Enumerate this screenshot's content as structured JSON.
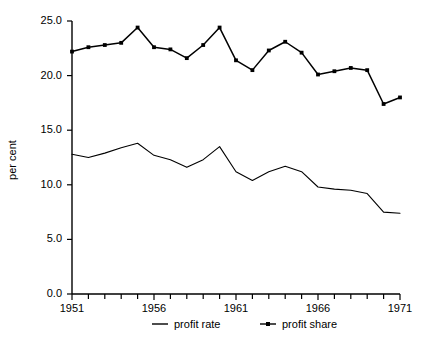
{
  "chart_data": {
    "type": "line",
    "title": "",
    "subtitle": "",
    "xlabel": "",
    "ylabel": "per cent",
    "x": [
      1951,
      1952,
      1953,
      1954,
      1955,
      1956,
      1957,
      1958,
      1959,
      1960,
      1961,
      1962,
      1963,
      1964,
      1965,
      1966,
      1967,
      1968,
      1969,
      1970,
      1971
    ],
    "xlim": [
      1951,
      1971
    ],
    "ylim": [
      0.0,
      25.0
    ],
    "grid": false,
    "legend_position": "bottom",
    "x_tick_labels": [
      "1951",
      "1956",
      "1961",
      "1966",
      "1971"
    ],
    "x_tick_values": [
      1951,
      1956,
      1961,
      1966,
      1971
    ],
    "x_minor_ticks_every": 1,
    "y_tick_labels": [
      "0.0",
      "5.0",
      "10.0",
      "15.0",
      "20.0",
      "25.0"
    ],
    "y_tick_values": [
      0.0,
      5.0,
      10.0,
      15.0,
      20.0,
      25.0
    ],
    "series": [
      {
        "name": "profit rate",
        "color": "#000000",
        "markers": false,
        "values": [
          12.8,
          12.5,
          12.9,
          13.4,
          13.8,
          12.7,
          12.3,
          11.6,
          12.3,
          13.5,
          11.2,
          10.4,
          11.2,
          11.7,
          11.2,
          9.8,
          9.6,
          9.5,
          9.2,
          7.5,
          7.4
        ]
      },
      {
        "name": "profit share",
        "color": "#000000",
        "markers": true,
        "values": [
          22.2,
          22.6,
          22.8,
          23.0,
          24.4,
          22.6,
          22.4,
          21.6,
          22.8,
          24.4,
          21.4,
          20.5,
          22.3,
          23.1,
          22.1,
          20.1,
          20.4,
          20.7,
          20.5,
          17.4,
          18.0
        ]
      }
    ]
  },
  "legend": {
    "items": [
      {
        "label": "profit rate",
        "style": "line"
      },
      {
        "label": "profit share",
        "style": "line-marker"
      }
    ]
  },
  "axes": {
    "y_axis_label": "per cent"
  }
}
